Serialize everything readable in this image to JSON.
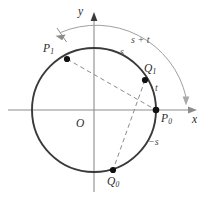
{
  "figure": {
    "width": 215,
    "height": 202,
    "background": "#ffffff"
  },
  "colors": {
    "circle": "#3a3a3a",
    "axis": "#8c8c8c",
    "dashed": "#8c8c8c",
    "arc": "#a0a0a0",
    "point": "#111111",
    "label": "#4d4d4d",
    "label_dark": "#2b2b2b"
  },
  "axes": {
    "x_label": "x",
    "y_label": "y",
    "origin_label": "O",
    "center_px": [
      94,
      110
    ],
    "radius_px": 62
  },
  "points": [
    {
      "id": "P1",
      "base": "P",
      "sub": "1",
      "label": "P₁",
      "x_px": 67,
      "y_px": 59,
      "angle_deg": 115.8
    },
    {
      "id": "Q1",
      "base": "Q",
      "sub": "1",
      "label": "Q₁",
      "x_px": 145,
      "y_px": 80,
      "angle_deg": 28.9
    },
    {
      "id": "P0",
      "base": "P",
      "sub": "0",
      "label": "P₀",
      "x_px": 156,
      "y_px": 110,
      "angle_deg": 0.0
    },
    {
      "id": "Q0",
      "base": "Q",
      "sub": "0",
      "label": "Q₀",
      "x_px": 113,
      "y_px": 170,
      "angle_deg": 284.0
    }
  ],
  "arc_labels": [
    {
      "id": "s_plus_t",
      "text": "s + t",
      "x_px": 131,
      "y_px": 41,
      "note": "outer arc from P0 around to P1"
    },
    {
      "id": "s",
      "text": "s",
      "x_px": 121,
      "y_px": 52,
      "note": "arc along circle from Q1 to P1"
    },
    {
      "id": "t",
      "text": "t",
      "x_px": 156,
      "y_px": 88,
      "note": "arc along circle from P0 to Q1"
    },
    {
      "id": "minus_s",
      "text": "−s",
      "x_px": 152,
      "y_px": 142,
      "note": "arc below P0 toward Q0"
    }
  ],
  "chords": [
    {
      "id": "chord-P1-P0",
      "from": "P1",
      "to": "P0",
      "style": "dashed"
    },
    {
      "id": "chord-Q1-Q0",
      "from": "Q1",
      "to": "Q0",
      "style": "dashed"
    }
  ],
  "outer_arc": {
    "id": "arc-s-plus-t",
    "style": "double-headed",
    "start_arrow": "down-left-at-P1",
    "end_arrow": "down-at-x-axis",
    "radius_px": 92
  }
}
